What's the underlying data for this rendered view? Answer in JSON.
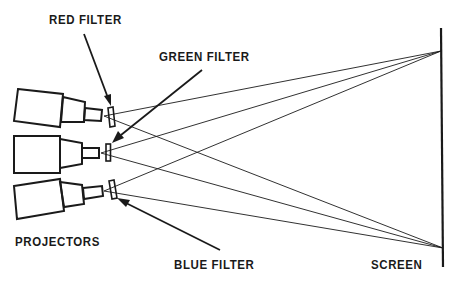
{
  "labels": {
    "red_filter": "RED FILTER",
    "green_filter": "GREEN FILTER",
    "blue_filter": "BLUE FILTER",
    "projectors": "PROJECTORS",
    "screen": "SCREEN"
  },
  "colors": {
    "ink": "#1a1a1a",
    "background": "#ffffff"
  }
}
